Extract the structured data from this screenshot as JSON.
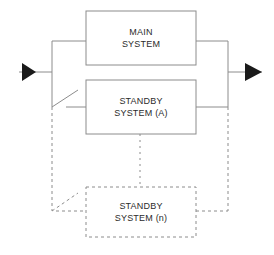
{
  "diagram": {
    "stroke_color": "#8c8c8c",
    "box_fill": "#ffffff",
    "text_color": "#2b2b2b",
    "arrow_color": "#1a1a1a",
    "blocks": [
      {
        "id": "main-system",
        "line1": "MAIN",
        "line2": "SYSTEM",
        "style": "solid"
      },
      {
        "id": "standby-system-a",
        "line1": "STANDBY",
        "line2": "SYSTEM (A)",
        "style": "solid"
      },
      {
        "id": "standby-system-n",
        "line1": "STANDBY",
        "line2": "SYSTEM (n)",
        "style": "dashed"
      }
    ],
    "connectors": {
      "input_arrow": "input-arrow",
      "output_arrow": "output-arrow",
      "input_bus": "input-bus-line",
      "output_bus": "output-bus-line",
      "switch_a": "switch-standby-a",
      "switch_n": "switch-standby-n",
      "continuation": "vertical-ellipsis-connector"
    }
  }
}
